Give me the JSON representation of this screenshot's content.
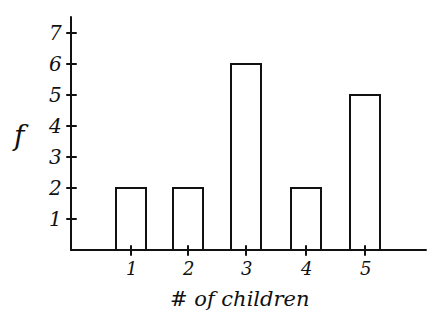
{
  "chart_data": {
    "type": "bar",
    "title": "",
    "xlabel": "# of children",
    "ylabel": "f",
    "categories": [
      "1",
      "2",
      "3",
      "4",
      "5"
    ],
    "values": [
      2,
      2,
      6,
      2,
      5
    ],
    "y_ticks": [
      "1",
      "2",
      "3",
      "4",
      "5",
      "6",
      "7"
    ],
    "ylim": [
      0,
      7
    ],
    "grid": false,
    "legend": null,
    "style": "hand-drawn, unfilled bars with black outlines"
  }
}
